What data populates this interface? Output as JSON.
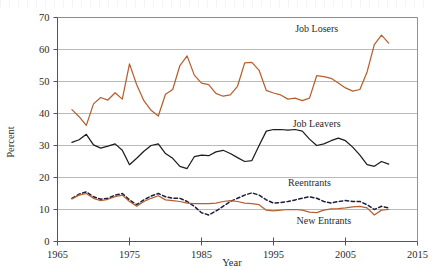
{
  "chart_data": {
    "type": "line",
    "title": "",
    "xlabel": "Year",
    "ylabel": "Percent",
    "xlim": [
      1965,
      2015
    ],
    "ylim": [
      0,
      70
    ],
    "grid": true,
    "legend_position": "inline-annotations",
    "xticks": [
      1965,
      1975,
      1985,
      1995,
      2005,
      2015
    ],
    "xtick_labels": [
      "1965",
      "1975",
      "1985",
      "1995",
      "2005",
      "2015"
    ],
    "yticks": [
      0,
      10,
      20,
      30,
      40,
      50,
      60,
      70
    ],
    "ytick_labels": [
      "0",
      "10",
      "20",
      "30",
      "40",
      "50",
      "60",
      "70"
    ],
    "x": [
      1967,
      1968,
      1969,
      1970,
      1971,
      1972,
      1973,
      1974,
      1975,
      1976,
      1977,
      1978,
      1979,
      1980,
      1981,
      1982,
      1983,
      1984,
      1985,
      1986,
      1987,
      1988,
      1989,
      1990,
      1991,
      1992,
      1993,
      1994,
      1995,
      1996,
      1997,
      1998,
      1999,
      2000,
      2001,
      2002,
      2003,
      2004,
      2005,
      2006,
      2007,
      2008,
      2009,
      2010,
      2011
    ],
    "series": [
      {
        "name": "Job Losers",
        "color": "#b5602e",
        "style": "solid",
        "label_x": 2001,
        "label_y": 66.5,
        "values": [
          41.2,
          39.0,
          36.3,
          43.0,
          45.0,
          44.2,
          46.5,
          44.5,
          55.5,
          49.0,
          44.0,
          41.0,
          39.2,
          46.0,
          47.5,
          55.0,
          58.0,
          52.0,
          49.5,
          49.0,
          46.3,
          45.4,
          45.8,
          48.5,
          55.8,
          56.0,
          53.5,
          47.2,
          46.4,
          45.8,
          44.5,
          44.8,
          44.0,
          44.8,
          51.8,
          51.5,
          51.0,
          49.5,
          48.0,
          47.0,
          47.5,
          53.0,
          61.5,
          64.5,
          62.0
        ]
      },
      {
        "name": "Job Leavers",
        "color": "#1c1c1c",
        "style": "solid",
        "label_x": 2001,
        "label_y": 37.0,
        "values": [
          31.0,
          31.8,
          33.5,
          30.2,
          29.2,
          29.8,
          30.5,
          28.5,
          24.0,
          26.0,
          28.2,
          30.0,
          30.5,
          27.5,
          26.0,
          23.5,
          22.8,
          26.5,
          27.0,
          26.8,
          28.0,
          28.5,
          27.5,
          26.2,
          25.0,
          25.3,
          30.0,
          34.5,
          35.0,
          35.0,
          34.8,
          35.0,
          34.5,
          32.0,
          30.0,
          30.5,
          31.5,
          32.3,
          31.5,
          29.5,
          27.0,
          24.0,
          23.5,
          25.0,
          24.2
        ]
      },
      {
        "name": "Reentrants",
        "color": "#1c1c3c",
        "style": "dashed",
        "label_x": 2000,
        "label_y": 18.3,
        "values": [
          13.5,
          14.8,
          15.5,
          14.0,
          13.2,
          13.5,
          14.5,
          15.0,
          13.0,
          11.5,
          13.0,
          14.2,
          15.0,
          14.0,
          13.5,
          13.5,
          12.5,
          11.0,
          9.0,
          8.3,
          9.5,
          11.0,
          12.5,
          13.5,
          14.5,
          15.2,
          14.5,
          13.0,
          12.0,
          12.2,
          12.5,
          13.0,
          13.5,
          14.0,
          13.5,
          12.5,
          12.0,
          12.5,
          12.8,
          12.5,
          12.5,
          11.5,
          10.0,
          11.0,
          10.5
        ]
      },
      {
        "name": "New Entrants",
        "color": "#b5602e",
        "style": "solid",
        "label_x": 2002,
        "label_y": 6.5,
        "values": [
          13.3,
          14.5,
          15.0,
          13.5,
          12.8,
          13.2,
          14.0,
          14.5,
          12.5,
          11.0,
          12.5,
          13.5,
          14.3,
          13.0,
          12.8,
          12.5,
          12.0,
          11.8,
          11.8,
          11.8,
          12.0,
          12.5,
          12.8,
          12.5,
          12.0,
          11.8,
          11.5,
          9.8,
          9.6,
          9.8,
          10.0,
          10.0,
          9.8,
          9.2,
          9.0,
          9.8,
          10.2,
          10.3,
          10.5,
          10.8,
          11.0,
          10.5,
          8.3,
          9.8,
          10.0
        ]
      }
    ]
  }
}
